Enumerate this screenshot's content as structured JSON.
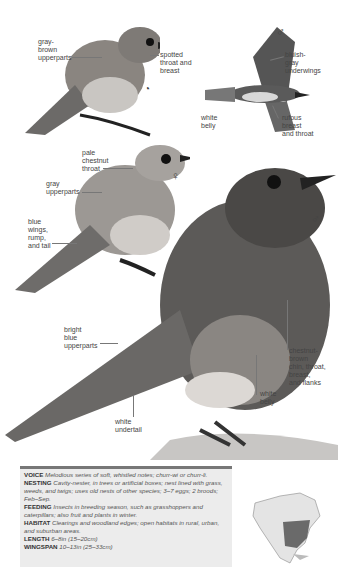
{
  "figures": {
    "juvenile": {
      "symbol": "juvenile-symbol",
      "labels": {
        "upperparts": "gray-\nbrown\nupperparts",
        "throat": "spotted\nthroat and\nbreast"
      }
    },
    "flight_male": {
      "symbol": "♂",
      "labels": {
        "underwings": "bluish-\ngray\nunderwings",
        "belly": "white\nbelly",
        "breast": "rufous\nbreast\nand throat"
      }
    },
    "female": {
      "symbol": "♀",
      "labels": {
        "throat": "pale\nchestnut\nthroat",
        "upperparts": "gray\nupperparts",
        "wings": "blue\nwings,\nrump,\nand tail"
      }
    },
    "male": {
      "symbol": "♂",
      "labels": {
        "upperparts": "bright\nblue\nupperparts",
        "chin": "chestnut-\nbrown\nchin, throat,\nbreast,\nand flanks",
        "belly": "white\nbelly",
        "undertail": "white\nundertail"
      }
    }
  },
  "info": {
    "voice": {
      "label": "VOICE",
      "text": "Melodious series of soft, whistled notes; churr-wi or churr-li."
    },
    "nesting": {
      "label": "NESTING",
      "text": "Cavity-nester, in trees or artificial boxes; nest lined with grass, weeds, and twigs; uses old nests of other species; 3–7 eggs; 2 broods; Feb–Sep."
    },
    "feeding": {
      "label": "FEEDING",
      "text": "Insects in breeding season, such as grasshoppers and caterpillars; also fruit and plants in winter."
    },
    "habitat": {
      "label": "HABITAT",
      "text": "Clearings and woodland edges; open habitats in rural, urban, and suburban areas."
    },
    "length": {
      "label": "LENGTH",
      "text": "6–8in (15–20cm)"
    },
    "wingspan": {
      "label": "WINGSPAN",
      "text": "10–13in (25–33cm)"
    }
  },
  "map": {
    "name": "range-map-north-america"
  }
}
